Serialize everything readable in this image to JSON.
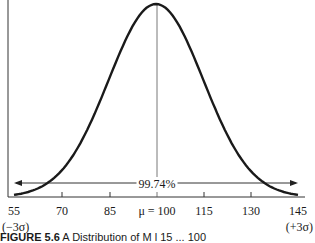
{
  "chart_data": {
    "type": "line",
    "title": "",
    "xlabel": "",
    "ylabel": "",
    "x_ticks": [
      "55",
      "70",
      "85",
      "μ = 100",
      "115",
      "130",
      "145"
    ],
    "x_tick_values": [
      55,
      70,
      85,
      100,
      115,
      130,
      145
    ],
    "xlim": [
      55,
      145
    ],
    "mean": 100,
    "sd": 15,
    "annotations": {
      "range_arrow_label": "99.74%",
      "left_sigma": "(−3σ)",
      "right_sigma": "(+3σ)"
    },
    "grid": false,
    "legend": null
  },
  "labels": {
    "ticks": [
      "55",
      "70",
      "85",
      "μ = 100",
      "115",
      "130",
      "145"
    ],
    "percent": "99.74%",
    "left_sigma": "(−3σ)",
    "right_sigma": "(+3σ)"
  },
  "caption": {
    "figure": "FIGURE 5.6",
    "text": "A Distribution of M l 15 ... 100"
  }
}
